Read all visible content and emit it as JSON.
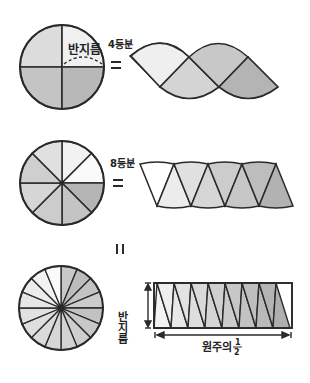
{
  "labels": {
    "radius_top": "반지름",
    "four_parts": "4등분",
    "eight_parts": "8등분",
    "equals_1": "=",
    "equals_2": "=",
    "equals_3": "=",
    "radius_rect": "반지름",
    "half_circumference": "원주의",
    "fraction_num": "1",
    "fraction_den": "2"
  },
  "colors": {
    "stroke": "#2a2a2a",
    "shade_1": "#f3f3f3",
    "shade_2": "#e2e2e2",
    "shade_3": "#d4d4d4",
    "shade_4": "#c4c4c4",
    "shade_5": "#b4b4b4"
  },
  "rows": [
    {
      "name": "four-division",
      "sectors": 4
    },
    {
      "name": "eight-division",
      "sectors": 8
    },
    {
      "name": "sixteen-division",
      "sectors": 16
    }
  ]
}
